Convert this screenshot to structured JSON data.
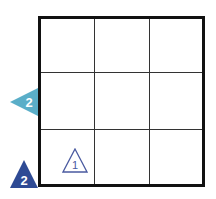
{
  "puzzle": {
    "rows": 3,
    "cols": 3,
    "colors": {
      "grid_border": "#111111",
      "grid_line": "#333333",
      "light_clue": "#5aaec8",
      "dark_clue": "#2e4a94",
      "cell_clue_outline": "#4a5aa0"
    },
    "left_clue": {
      "value": "2",
      "row": 2,
      "direction": "left-pointing-triangle"
    },
    "corner_clue": {
      "value": "2",
      "position": "bottom-left",
      "direction": "up-pointing-triangle"
    },
    "cell_clue": {
      "value": "1",
      "row": 3,
      "col": 1,
      "style": "outlined-triangle"
    }
  }
}
